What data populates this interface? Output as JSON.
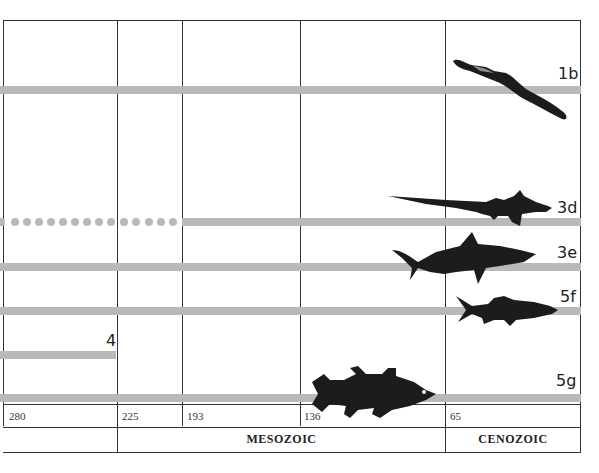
{
  "diagram": {
    "type": "evolutionary timeline chart",
    "lineages": [
      {
        "id": "1b",
        "label": "1b",
        "start_mya": 65,
        "style": "solid"
      },
      {
        "id": "3d",
        "label": "3d",
        "start_mya": 193,
        "style": "dotted-then-solid",
        "dotted_from_mya": 280
      },
      {
        "id": "3e",
        "label": "3e",
        "start_mya": 280,
        "style": "solid"
      },
      {
        "id": "5f",
        "label": "5f",
        "start_mya": 280,
        "style": "solid"
      },
      {
        "id": "4",
        "label": "4",
        "start_mya": 280,
        "end_mya": 225,
        "style": "solid"
      },
      {
        "id": "5g",
        "label": "5g",
        "start_mya": 280,
        "style": "solid"
      }
    ],
    "time_ticks": [
      "280",
      "225",
      "193",
      "136",
      "65"
    ],
    "eras": [
      {
        "label": "",
        "from": "280",
        "to": "225"
      },
      {
        "label": "MESOZOIC",
        "from": "225",
        "to": "65"
      },
      {
        "label": "CENOZOIC",
        "from": "65",
        "to": "present"
      }
    ],
    "silhouettes": [
      "eel-icon",
      "frilled-shark-icon",
      "shark-icon",
      "bony-fish-icon",
      "coelacanth-icon"
    ],
    "colors": {
      "bar": "#b9b9b9",
      "lines": "#333333",
      "silhouette": "#1c1c1c"
    }
  }
}
